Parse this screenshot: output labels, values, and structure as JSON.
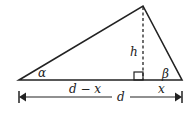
{
  "diagram": {
    "type": "triangle-with-altitude",
    "labels": {
      "alpha": "α",
      "beta": "β",
      "height": "h",
      "left_segment": "d − x",
      "right_segment": "x",
      "base": "d"
    },
    "colors": {
      "stroke": "#222222",
      "background": "#ffffff"
    }
  }
}
